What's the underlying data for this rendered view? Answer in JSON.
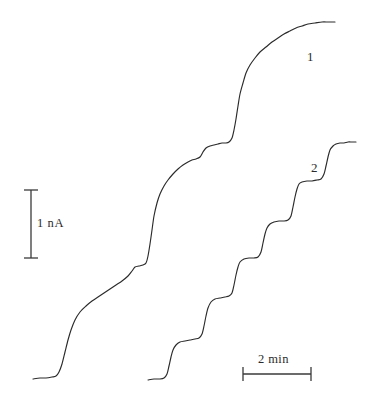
{
  "figure": {
    "background_color": "#ffffff",
    "trace_color": "#2b2b2b",
    "scalebar_color": "#3a3a3a",
    "labels": {
      "trace_1": "1",
      "trace_2": "2",
      "current_scale": "1 nA",
      "time_scale": "2 min"
    }
  },
  "chart_data": {
    "type": "line",
    "title": "",
    "subtitle": "",
    "xlabel": "",
    "ylabel": "",
    "grid": false,
    "legend_position": "inline-right",
    "axes_shown": false,
    "scale_bars": [
      {
        "name": "current-scale-bar",
        "orientation": "vertical",
        "label": "1 nA",
        "value": 1,
        "unit": "nA",
        "x": 31,
        "y_top": 190,
        "y_bottom": 258,
        "length_px": 68,
        "cap_half_width": 7
      },
      {
        "name": "time-scale-bar",
        "orientation": "horizontal",
        "label": "2 min",
        "value": 2,
        "unit": "min",
        "y": 374,
        "x_left": 243,
        "x_right": 311,
        "length_px": 68,
        "cap_half_height": 7
      }
    ],
    "series": [
      {
        "name": "1",
        "label": "1",
        "label_position": {
          "x": 307,
          "y": 50
        },
        "description": "Upper staircase current trace with smooth rising steps",
        "points": [
          [
            33,
            379
          ],
          [
            40,
            378
          ],
          [
            46,
            378
          ],
          [
            52,
            377
          ],
          [
            56,
            376
          ],
          [
            59,
            372
          ],
          [
            62,
            364
          ],
          [
            65,
            352
          ],
          [
            68,
            340
          ],
          [
            71,
            330
          ],
          [
            75,
            320
          ],
          [
            80,
            312
          ],
          [
            86,
            306
          ],
          [
            92,
            301
          ],
          [
            98,
            297
          ],
          [
            104,
            293
          ],
          [
            110,
            289
          ],
          [
            116,
            285
          ],
          [
            122,
            281
          ],
          [
            128,
            276
          ],
          [
            132,
            271
          ],
          [
            135,
            267
          ],
          [
            139,
            266
          ],
          [
            143,
            265
          ],
          [
            146,
            263
          ],
          [
            148,
            256
          ],
          [
            150,
            244
          ],
          [
            152,
            230
          ],
          [
            154,
            216
          ],
          [
            157,
            203
          ],
          [
            160,
            194
          ],
          [
            164,
            186
          ],
          [
            168,
            180
          ],
          [
            173,
            174
          ],
          [
            178,
            169
          ],
          [
            183,
            165
          ],
          [
            188,
            162
          ],
          [
            192,
            160
          ],
          [
            196,
            159
          ],
          [
            200,
            157
          ],
          [
            203,
            152
          ],
          [
            206,
            148
          ],
          [
            210,
            146
          ],
          [
            214,
            145
          ],
          [
            218,
            144
          ],
          [
            222,
            143
          ],
          [
            226,
            143
          ],
          [
            229,
            142
          ],
          [
            232,
            138
          ],
          [
            234,
            130
          ],
          [
            236,
            119
          ],
          [
            238,
            106
          ],
          [
            240,
            94
          ],
          [
            243,
            83
          ],
          [
            246,
            73
          ],
          [
            250,
            65
          ],
          [
            255,
            58
          ],
          [
            260,
            52
          ],
          [
            266,
            47
          ],
          [
            272,
            42
          ],
          [
            278,
            38
          ],
          [
            284,
            34
          ],
          [
            290,
            31
          ],
          [
            296,
            28
          ],
          [
            302,
            26
          ],
          [
            308,
            24
          ],
          [
            315,
            23
          ],
          [
            322,
            22
          ],
          [
            328,
            22
          ],
          [
            335,
            22
          ]
        ]
      },
      {
        "name": "2",
        "label": "2",
        "label_position": {
          "x": 311,
          "y": 161
        },
        "description": "Lower staircase current trace with discrete square steps",
        "points": [
          [
            148,
            380
          ],
          [
            154,
            379
          ],
          [
            160,
            379
          ],
          [
            164,
            378
          ],
          [
            167,
            374
          ],
          [
            169,
            366
          ],
          [
            171,
            357
          ],
          [
            173,
            350
          ],
          [
            176,
            345
          ],
          [
            180,
            342
          ],
          [
            185,
            341
          ],
          [
            190,
            340
          ],
          [
            195,
            339
          ],
          [
            199,
            338
          ],
          [
            202,
            334
          ],
          [
            204,
            326
          ],
          [
            206,
            316
          ],
          [
            208,
            308
          ],
          [
            211,
            302
          ],
          [
            215,
            299
          ],
          [
            220,
            298
          ],
          [
            225,
            297
          ],
          [
            229,
            296
          ],
          [
            232,
            293
          ],
          [
            234,
            285
          ],
          [
            236,
            275
          ],
          [
            238,
            267
          ],
          [
            240,
            262
          ],
          [
            244,
            259
          ],
          [
            249,
            258
          ],
          [
            254,
            258
          ],
          [
            258,
            257
          ],
          [
            261,
            252
          ],
          [
            263,
            243
          ],
          [
            265,
            234
          ],
          [
            267,
            228
          ],
          [
            270,
            224
          ],
          [
            274,
            222
          ],
          [
            279,
            221
          ],
          [
            284,
            221
          ],
          [
            288,
            220
          ],
          [
            291,
            216
          ],
          [
            293,
            207
          ],
          [
            295,
            197
          ],
          [
            297,
            189
          ],
          [
            299,
            184
          ],
          [
            302,
            182
          ],
          [
            307,
            181
          ],
          [
            312,
            181
          ],
          [
            317,
            180
          ],
          [
            321,
            179
          ],
          [
            324,
            174
          ],
          [
            326,
            166
          ],
          [
            328,
            157
          ],
          [
            330,
            150
          ],
          [
            333,
            146
          ],
          [
            336,
            144
          ],
          [
            340,
            143
          ],
          [
            344,
            143
          ],
          [
            348,
            142
          ],
          [
            352,
            142
          ],
          [
            356,
            142
          ]
        ]
      }
    ]
  }
}
